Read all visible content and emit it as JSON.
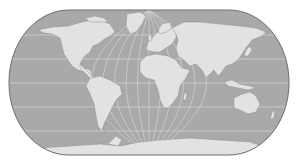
{
  "map": {
    "title": "World map (Natural Earth / Robinson-like projection)",
    "projection": "pseudocylindrical",
    "colors": {
      "background": "#ffffff",
      "ocean": "#a9a9a9",
      "land": "#e2e2e2",
      "graticule": "#d8d8d8",
      "outline": "#6e6e6e",
      "coast": "#7a7a7a"
    },
    "frame": {
      "left": 9,
      "right": 289,
      "top": 10,
      "bottom": 155,
      "corner_radius": 60
    },
    "graticule": {
      "parallels_y": [
        35,
        59,
        83,
        107,
        131
      ],
      "central_meridian_x": 149,
      "meridian_offsets": [
        -115,
        -92,
        -69,
        -46,
        -23,
        23,
        46,
        69,
        92,
        115
      ]
    },
    "continents": [
      "North America",
      "Greenland",
      "South America",
      "Europe",
      "Africa",
      "Asia",
      "Australia",
      "Antarctica"
    ]
  }
}
